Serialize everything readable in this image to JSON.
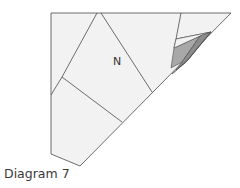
{
  "figure": {
    "caption": "Diagram 7",
    "region_label": "N",
    "colors": {
      "paper": "#f2f2f2",
      "stroke": "#4a4a4a",
      "shade_light": "#a8a8a8",
      "shade_mid": "#8c8c8c",
      "shade_dark": "#5e5e5e"
    }
  }
}
